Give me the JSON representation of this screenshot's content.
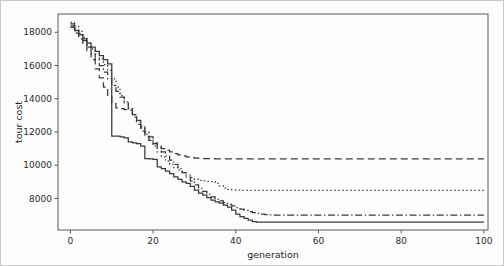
{
  "chart_data": {
    "type": "line",
    "title": "",
    "xlabel": "generation",
    "ylabel": "tour cost",
    "xlim": [
      -3,
      101
    ],
    "ylim": [
      6100,
      19100
    ],
    "grid": false,
    "legend": "none",
    "xticks": [
      0,
      20,
      40,
      60,
      80,
      100
    ],
    "xtick_labels": [
      "0",
      "20",
      "40",
      "60",
      "80",
      "100"
    ],
    "yticks": [
      8000,
      10000,
      12000,
      14000,
      16000,
      18000
    ],
    "ytick_labels": [
      "8000",
      "10000",
      "12000",
      "14000",
      "16000",
      "18000"
    ],
    "x": [
      0,
      1,
      2,
      3,
      4,
      5,
      6,
      7,
      8,
      9,
      10,
      11,
      12,
      13,
      14,
      15,
      16,
      17,
      18,
      19,
      20,
      21,
      22,
      23,
      24,
      25,
      26,
      27,
      28,
      29,
      30,
      31,
      32,
      33,
      34,
      35,
      36,
      37,
      38,
      39,
      40,
      41,
      42,
      43,
      44,
      45,
      46,
      47,
      48,
      49,
      50,
      51,
      52,
      53,
      54,
      55,
      56,
      57,
      58,
      59,
      60,
      61,
      62,
      63,
      64,
      65,
      66,
      67,
      68,
      69,
      70,
      71,
      72,
      73,
      74,
      75,
      76,
      77,
      78,
      79,
      80,
      81,
      82,
      83,
      84,
      85,
      86,
      87,
      88,
      89,
      90,
      91,
      92,
      93,
      94,
      95,
      96,
      97,
      98,
      99,
      100
    ],
    "series": [
      {
        "name": "solid",
        "linestyle": "solid",
        "color": "#3a3a3a",
        "final_value": 6570,
        "values": [
          18380,
          18100,
          17850,
          17600,
          17350,
          17100,
          16850,
          16600,
          16350,
          16100,
          11750,
          11750,
          11700,
          11650,
          11400,
          11350,
          11300,
          11150,
          10400,
          10380,
          10350,
          9900,
          9800,
          9650,
          9500,
          9300,
          9150,
          9000,
          8900,
          8720,
          8500,
          8320,
          8200,
          8050,
          7900,
          7800,
          7720,
          7600,
          7480,
          7300,
          7050,
          6900,
          6800,
          6700,
          6600,
          6575,
          6570,
          6570,
          6570,
          6570,
          6570,
          6570,
          6570,
          6570,
          6570,
          6570,
          6570,
          6570,
          6570,
          6570,
          6570,
          6570,
          6570,
          6570,
          6570,
          6570,
          6570,
          6570,
          6570,
          6570,
          6570,
          6570,
          6570,
          6570,
          6570,
          6570,
          6570,
          6570,
          6570,
          6570,
          6570,
          6570,
          6570,
          6570,
          6570,
          6570,
          6570,
          6570,
          6570,
          6570,
          6570,
          6570,
          6570,
          6570,
          6570,
          6570,
          6570,
          6570,
          6570,
          6570,
          6570
        ]
      },
      {
        "name": "dashed",
        "linestyle": "dashed",
        "color": "#3a3a3a",
        "final_value": 10380,
        "values": [
          18300,
          17950,
          17600,
          17250,
          16900,
          16350,
          15800,
          15250,
          14700,
          14200,
          13700,
          13450,
          13400,
          13350,
          13300,
          12900,
          12450,
          12050,
          11700,
          11500,
          11300,
          11150,
          11000,
          10900,
          10800,
          10700,
          10620,
          10560,
          10500,
          10460,
          10430,
          10410,
          10400,
          10395,
          10390,
          10388,
          10385,
          10383,
          10382,
          10381,
          10380,
          10380,
          10380,
          10380,
          10380,
          10380,
          10380,
          10380,
          10380,
          10380,
          10380,
          10380,
          10380,
          10380,
          10380,
          10380,
          10380,
          10380,
          10380,
          10380,
          10380,
          10380,
          10380,
          10380,
          10380,
          10380,
          10380,
          10380,
          10380,
          10380,
          10380,
          10380,
          10380,
          10380,
          10380,
          10380,
          10380,
          10380,
          10380,
          10380,
          10380,
          10380,
          10380,
          10380,
          10380,
          10380,
          10380,
          10380,
          10380,
          10380,
          10380,
          10380,
          10380,
          10380,
          10380,
          10380,
          10380,
          10380,
          10380,
          10380,
          10380
        ]
      },
      {
        "name": "dotted",
        "linestyle": "dotted",
        "color": "#3a3a3a",
        "final_value": 8480,
        "values": [
          18600,
          18350,
          18050,
          17700,
          17350,
          17000,
          16700,
          16400,
          16050,
          15700,
          15200,
          14700,
          14200,
          13800,
          13400,
          13050,
          12650,
          12250,
          11850,
          11500,
          11150,
          10800,
          10500,
          10250,
          10050,
          9850,
          9700,
          9550,
          9400,
          9250,
          9150,
          9080,
          9050,
          9030,
          9010,
          8900,
          8750,
          8620,
          8550,
          8520,
          8500,
          8490,
          8485,
          8482,
          8481,
          8480,
          8480,
          8480,
          8480,
          8480,
          8480,
          8480,
          8480,
          8480,
          8480,
          8480,
          8480,
          8480,
          8480,
          8480,
          8480,
          8480,
          8480,
          8480,
          8480,
          8480,
          8480,
          8480,
          8480,
          8480,
          8480,
          8480,
          8480,
          8480,
          8480,
          8480,
          8480,
          8480,
          8480,
          8480,
          8480,
          8480,
          8480,
          8480,
          8480,
          8480,
          8480,
          8480,
          8480,
          8480,
          8480,
          8480,
          8480,
          8480,
          8480,
          8480,
          8480,
          8480,
          8480,
          8480,
          8480
        ]
      },
      {
        "name": "dash-dot",
        "linestyle": "dashdot",
        "color": "#3a3a3a",
        "final_value": 6990,
        "values": [
          18500,
          18200,
          17900,
          17500,
          17100,
          16700,
          16350,
          16000,
          15600,
          15200,
          14800,
          14450,
          14100,
          13750,
          13400,
          13050,
          12700,
          12350,
          12000,
          11700,
          11350,
          11050,
          10800,
          10550,
          10300,
          10050,
          9800,
          9550,
          9300,
          9050,
          8820,
          8600,
          8420,
          8250,
          8100,
          7950,
          7850,
          7750,
          7650,
          7550,
          7450,
          7350,
          7280,
          7200,
          7150,
          7100,
          7060,
          7030,
          7010,
          7000,
          6995,
          6992,
          6990,
          6990,
          6990,
          6990,
          6990,
          6990,
          6990,
          6990,
          6990,
          6990,
          6990,
          6990,
          6990,
          6990,
          6990,
          6990,
          6990,
          6990,
          6990,
          6990,
          6990,
          6990,
          6990,
          6990,
          6990,
          6990,
          6990,
          6990,
          6990,
          6990,
          6990,
          6990,
          6990,
          6990,
          6990,
          6990,
          6990,
          6990,
          6990,
          6990,
          6990,
          6990,
          6990,
          6990,
          6990,
          6990,
          6990,
          6990,
          6990
        ]
      }
    ]
  }
}
